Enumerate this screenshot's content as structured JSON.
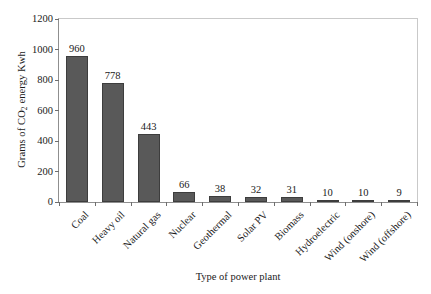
{
  "chart_data": {
    "type": "bar",
    "title": "",
    "xlabel": "Type of power plant",
    "ylabel": "Grams of CO2 energy Kwh",
    "ylabel_prefix": "Grams of CO",
    "ylabel_subscript": "2",
    "ylabel_suffix": " energy Kwh",
    "categories": [
      "Coal",
      "Heavy oil",
      "Natural gas",
      "Nuclear",
      "Geothermal",
      "Solar PV",
      "Biomass",
      "Hydroelectric",
      "Wind (onshore)",
      "Wind (offshore)"
    ],
    "values": [
      960,
      778,
      443,
      66,
      38,
      32,
      31,
      10,
      10,
      9
    ],
    "value_labels": [
      "960",
      "778",
      "443",
      "66",
      "38",
      "32",
      "31",
      "10",
      "10",
      "9"
    ],
    "ylim": [
      0,
      1200
    ],
    "ytick_values": [
      0,
      200,
      400,
      600,
      800,
      1000,
      1200
    ],
    "ytick_labels": [
      "0",
      "200",
      "400",
      "600",
      "800",
      "1000",
      "1200"
    ],
    "grid": false,
    "legend": false,
    "bar_color": "#595959",
    "bar_edge_color": "#3d3d3d",
    "axis_color": "#8f8f8f",
    "text_color": "#1a1a1a",
    "background": "#ffffff"
  }
}
